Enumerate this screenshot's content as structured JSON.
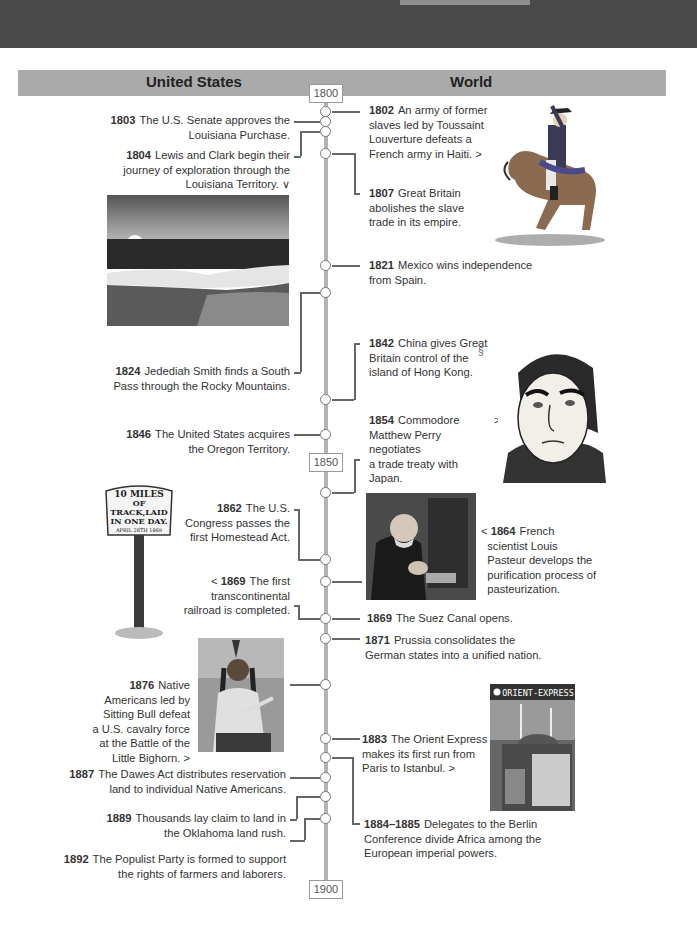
{
  "header": {
    "left_label": "United States",
    "right_label": "World"
  },
  "timeline": {
    "start_year": "1800",
    "mid_year": "1850",
    "end_year": "1900",
    "line_color": "#b3b3b3",
    "header_color": "#aaaaaa",
    "top_band_color": "#4a4a4a"
  },
  "us_events": [
    {
      "year": "1803",
      "text": "The U.S. Senate approves the Louisiana Purchase.",
      "line1": "The U.S. Senate approves the",
      "line2": "Louisiana Purchase."
    },
    {
      "year": "1804",
      "text": "Lewis and Clark begin their journey of exploration through the Louisiana Territory.",
      "line1": "Lewis and Clark begin their",
      "line2": "journey of exploration through the",
      "line3": "Louisiana Territory.",
      "arrow": "∨"
    },
    {
      "year": "1824",
      "text": "Jedediah Smith finds a South Pass through the Rocky Mountains.",
      "line1": "Jedediah Smith finds a South",
      "line2": "Pass through the Rocky Mountains."
    },
    {
      "year": "1846",
      "text": "The United States acquires the Oregon Territory.",
      "line1": "The United States acquires",
      "line2": "the Oregon Territory."
    },
    {
      "year": "1862",
      "text": "The U.S. Congress passes the first Homestead Act.",
      "line1": "The U.S.",
      "line2": "Congress passes the",
      "line3": "first Homestead Act."
    },
    {
      "year": "1869",
      "text": "The first transcontinental railroad is completed.",
      "line1": "The first",
      "line2": "transcontinental",
      "line3": "railroad is completed.",
      "arrow": "<"
    },
    {
      "year": "1876",
      "text": "Native Americans led by Sitting Bull defeat a U.S. cavalry force at the Battle of the Little Bighorn.",
      "line1": "Native",
      "line2": "Americans led by",
      "line3": "Sitting Bull defeat",
      "line4": "a U.S. cavalry force",
      "line5": "at the Battle of the",
      "line6": "Little Bighorn.",
      "arrow": ">"
    },
    {
      "year": "1887",
      "text": "The Dawes Act distributes reservation land to individual Native Americans.",
      "line1": "The Dawes Act distributes reservation",
      "line2": "land to individual Native Americans."
    },
    {
      "year": "1889",
      "text": "Thousands lay claim to land in the Oklahoma land rush.",
      "line1": "Thousands lay claim to land in",
      "line2": "the Oklahoma land rush."
    },
    {
      "year": "1892",
      "text": "The Populist Party is formed to support the rights of farmers and laborers.",
      "line1": "The Populist Party is formed to support",
      "line2": "the rights of farmers and laborers."
    }
  ],
  "world_events": [
    {
      "year": "1802",
      "text": "An army of former slaves led by Toussaint Louverture defeats a French army in Haiti.",
      "line1": "An army of former",
      "line2": "slaves led by Toussaint",
      "line3": "Louverture defeats a",
      "line4": "French army in Haiti.",
      "arrow": ">"
    },
    {
      "year": "1807",
      "text": "Great Britain abolishes the slave trade in its empire.",
      "line1": "Great Britain",
      "line2": "abolishes the slave",
      "line3": "trade in its empire."
    },
    {
      "year": "1821",
      "text": "Mexico wins independence from Spain.",
      "line1": "Mexico wins independence",
      "line2": "from Spain."
    },
    {
      "year": "1842",
      "text": "China gives Great Britain control of the island of Hong Kong.",
      "line1": "China gives Great",
      "line2": "Britain control of the",
      "line3": "island of Hong Kong."
    },
    {
      "year": "1854",
      "text": "Commodore Matthew Perry negotiates a trade treaty with Japan.",
      "line1": "Commodore",
      "line2": "Matthew Perry negotiates",
      "line3": "a trade treaty with Japan.",
      "arrow": ">"
    },
    {
      "year": "1864",
      "text": "French scientist Louis Pasteur develops the purification process of pasteurization.",
      "line1": "French",
      "line2": "scientist Louis",
      "line3": "Pasteur develops the",
      "line4": "purification process of",
      "line5": "pasteurization.",
      "arrow": "<"
    },
    {
      "year": "1869",
      "text": "The Suez Canal opens.",
      "line1": "The Suez Canal opens."
    },
    {
      "year": "1871",
      "text": "Prussia consolidates the German states into a unified nation.",
      "line1": "Prussia consolidates the",
      "line2": "German states into a unified nation."
    },
    {
      "year": "1883",
      "text": "The Orient Express makes its first run from Paris to Istanbul.",
      "line1": "The Orient Express",
      "line2": "makes its first run from",
      "line3": "Paris to Istanbul.",
      "arrow": ">"
    },
    {
      "year": "1884–1885",
      "text": "Delegates to the Berlin Conference divide Africa among the European imperial powers.",
      "line1": "Delegates to the Berlin",
      "line2": "Conference divide Africa among the",
      "line3": "European imperial powers."
    }
  ],
  "images": {
    "toussaint": "Toussaint Louverture on horseback illustration",
    "river": "Sunset over river landscape photo",
    "perry": "Japanese portrait of Commodore Perry",
    "sign": "Railroad sign",
    "sign_text": [
      "10 MILES",
      "OF",
      "TRACK,LAID",
      "IN ONE DAY.",
      "APRIL 28TH 1869"
    ],
    "pasteur": "Portrait of Louis Pasteur in laboratory",
    "sitting_bull": "Portrait of Sitting Bull",
    "orient_express": "Orient Express poster",
    "orient_express_title": "ORIENT-EXPRESS"
  }
}
